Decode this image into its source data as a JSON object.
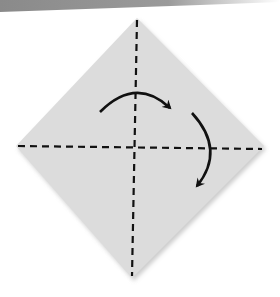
{
  "diagram": {
    "type": "origami-step",
    "colors": {
      "background": "#ffffff",
      "top_band": "#8c8c8c",
      "paper": "#dcdcdc",
      "paper_shadow": "#bdbdbd",
      "lines": "#111111"
    },
    "paper": {
      "shape": "diamond",
      "top": [
        137,
        18
      ],
      "right": [
        264,
        146
      ],
      "bottom": [
        132,
        278
      ],
      "left": [
        16,
        146
      ]
    },
    "fold_lines": [
      {
        "name": "vertical-valley-fold",
        "style": "dashed",
        "from": [
          137,
          20
        ],
        "to": [
          132,
          276
        ]
      },
      {
        "name": "horizontal-valley-fold",
        "style": "dashed",
        "from": [
          18,
          146
        ],
        "to": [
          262,
          149
        ]
      }
    ],
    "arrows": [
      {
        "name": "rotate-arrow-top",
        "direction": "clockwise",
        "start": [
          100,
          112
        ],
        "control": [
          136,
          82
        ],
        "end": [
          172,
          110
        ]
      },
      {
        "name": "rotate-arrow-right",
        "direction": "clockwise",
        "start": [
          192,
          113
        ],
        "control": [
          224,
          150
        ],
        "end": [
          196,
          188
        ]
      }
    ]
  }
}
